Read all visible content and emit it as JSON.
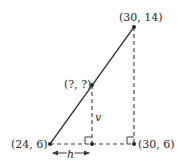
{
  "diagram": {
    "points": {
      "start": {
        "label": "(24, 6)"
      },
      "end": {
        "label": "(30, 14)"
      },
      "unknown": {
        "label": "(?, ?)"
      },
      "corner": {
        "label": "(30, 6)"
      }
    },
    "labels": {
      "vertical": "v",
      "horizontal": "h"
    },
    "colors": {
      "line": "#3a3a3a",
      "text": "#2a2a2a"
    }
  }
}
